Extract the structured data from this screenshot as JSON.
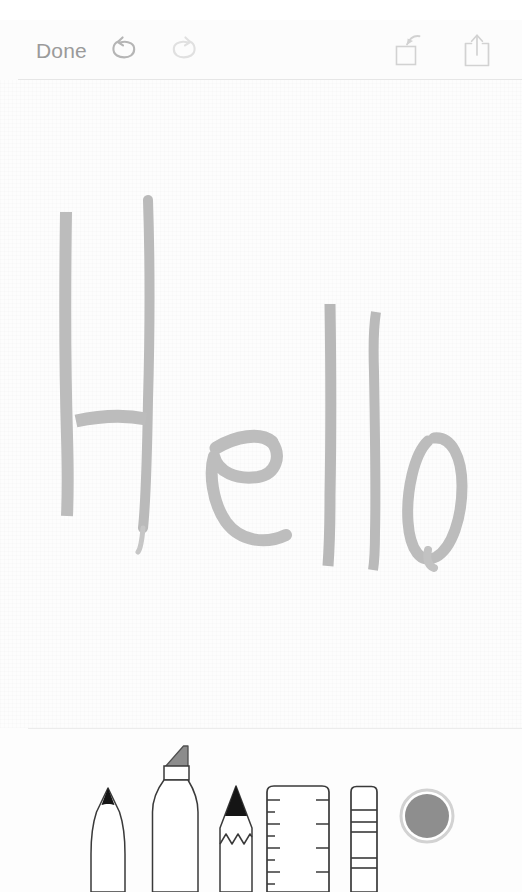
{
  "app": {
    "name": "Notes Drawing Markup",
    "canvas_bg": "#fdfdfd",
    "stroke_color": "#b9b9b9",
    "ui_gray": "#9a9a9a"
  },
  "toolbar": {
    "done_label": "Done",
    "undo": {
      "name": "undo-button",
      "icon": "undo-arrow-icon",
      "enabled": true,
      "color": "#b5b5b5"
    },
    "redo": {
      "name": "redo-button",
      "icon": "redo-arrow-icon",
      "enabled": false,
      "color": "#e0e0e0"
    },
    "markup_add": {
      "name": "insert-markup-button",
      "icon": "square-with-arrow-icon",
      "color": "#d2d2d2"
    },
    "share": {
      "name": "share-button",
      "icon": "share-up-arrow-icon",
      "color": "#d2d2d2"
    }
  },
  "drawing": {
    "content_text": "Hello",
    "description": "Handwritten word drawn in light gray marker strokes",
    "stroke_color": "#b9b9b9",
    "stroke_color_light": "#c9c9c9",
    "letters": [
      "H",
      "e",
      "l",
      "l",
      "o"
    ]
  },
  "palette": {
    "tools": [
      {
        "id": "pen",
        "label": "Pen",
        "icon": "pen-tip-icon",
        "selected": false,
        "tip_color": "#1c1c1c"
      },
      {
        "id": "marker",
        "label": "Marker",
        "icon": "marker-chisel-icon",
        "selected": false,
        "tip_color": "#808080"
      },
      {
        "id": "pencil",
        "label": "Pencil",
        "icon": "pencil-tip-icon",
        "selected": false,
        "tip_color": "#1c1c1c"
      },
      {
        "id": "ruler",
        "label": "Ruler",
        "icon": "ruler-icon",
        "selected": false,
        "tip_color": "#4a4a4a"
      },
      {
        "id": "eraser",
        "label": "Eraser",
        "icon": "eraser-icon",
        "selected": false,
        "tip_color": "#4a4a4a"
      }
    ],
    "color_swatch": {
      "label": "Color",
      "icon": "color-swatch-icon",
      "color": "#8e8e8e",
      "ring_color": "#cfcfcf"
    }
  }
}
